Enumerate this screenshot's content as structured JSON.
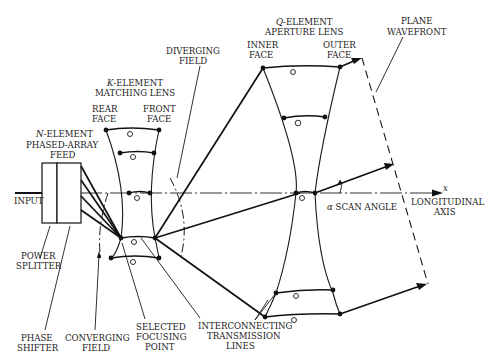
{
  "diagram": {
    "labels": {
      "input": "INPUT",
      "feed_prefix": "N",
      "feed_line1": "-ELEMENT",
      "feed_line2": "PHASED-ARRAY",
      "feed_line3": "FEED",
      "matching_prefix": "K",
      "matching_line1": "-ELEMENT",
      "matching_line2": "MATCHING LENS",
      "rear_face_1": "REAR",
      "rear_face_2": "FACE",
      "front_face_1": "FRONT",
      "front_face_2": "FACE",
      "diverging_1": "DIVERGING",
      "diverging_2": "FIELD",
      "aperture_prefix": "Q",
      "aperture_line1": "-ELEMENT",
      "aperture_line2": "APERTURE LENS",
      "inner_face_1": "INNER",
      "inner_face_2": "FACE",
      "outer_face_1": "OUTER",
      "outer_face_2": "FACE",
      "plane_wavefront_1": "PLANE",
      "plane_wavefront_2": "WAVEFRONT",
      "x_axis": "x",
      "longitudinal_1": "LONGITUDINAL",
      "longitudinal_2": "AXIS",
      "scan_angle_symbol": "α",
      "scan_angle": "SCAN ANGLE",
      "power_splitter_1": "POWER",
      "power_splitter_2": "SPLITTER",
      "phase_shifter_1": "PHASE",
      "phase_shifter_2": "SHIFTER",
      "converging_1": "CONVERGING",
      "converging_2": "FIELD",
      "selected_1": "SELECTED",
      "selected_2": "FOCUSING",
      "selected_3": "POINT",
      "interconnecting_1": "INTERCONNECTING",
      "interconnecting_2": "TRANSMISSION",
      "interconnecting_3": "LINES"
    },
    "components": [
      "input-line",
      "power-splitter",
      "phase-shifter",
      "matching-lens",
      "aperture-lens",
      "plane-wavefront",
      "longitudinal-axis",
      "scan-angle"
    ]
  }
}
